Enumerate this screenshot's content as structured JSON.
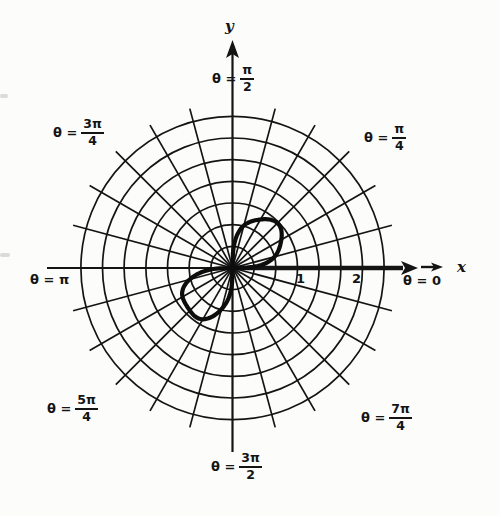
{
  "chart_data": {
    "type": "line",
    "projection": "polar",
    "title": "",
    "curve": {
      "equation": "r^2 = sin(2θ)",
      "theta_domains_deg": [
        [
          0,
          90
        ],
        [
          180,
          270
        ]
      ],
      "max_r_units": 1,
      "lobe_directions_deg": [
        45,
        225
      ]
    },
    "grid": {
      "circle_radii_units": [
        0.333,
        0.667,
        1,
        1.333,
        1.667,
        2,
        2.333
      ],
      "ray_spacing_deg": 15,
      "grid_on": true
    },
    "axes": {
      "x_label": "x",
      "y_label": "y",
      "x_ticks": [
        "1",
        "2"
      ],
      "x_tick_values": [
        1,
        2
      ],
      "r_range": [
        0,
        2.333
      ]
    },
    "angle_labels": [
      {
        "prefix": "θ =",
        "num": "π",
        "den": "2",
        "angle_deg": 90
      },
      {
        "prefix": "θ =",
        "num": "3π",
        "den": "4",
        "angle_deg": 135
      },
      {
        "prefix": "θ =",
        "num": "π",
        "den": "4",
        "angle_deg": 45
      },
      {
        "text": "θ = π",
        "angle_deg": 180
      },
      {
        "text": "θ = 0",
        "angle_deg": 0
      },
      {
        "prefix": "θ =",
        "num": "5π",
        "den": "4",
        "angle_deg": 225
      },
      {
        "prefix": "θ =",
        "num": "7π",
        "den": "4",
        "angle_deg": 315
      },
      {
        "prefix": "θ =",
        "num": "3π",
        "den": "2",
        "angle_deg": 270
      }
    ],
    "ink_color": "#141414",
    "paper_color": "#fcfcfa"
  }
}
